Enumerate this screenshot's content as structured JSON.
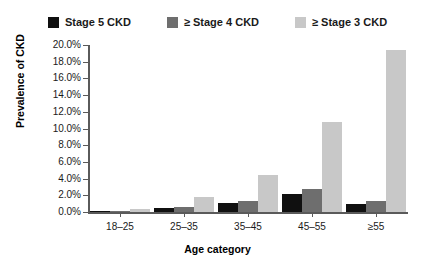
{
  "chart_data": {
    "type": "bar",
    "title": "",
    "xlabel": "Age category",
    "ylabel": "Prevalence of CKD",
    "categories": [
      "18–25",
      "25–35",
      "35–45",
      "45–55",
      "≥55"
    ],
    "ylim": [
      0,
      20
    ],
    "ytick_step": 2,
    "ytick_labels": [
      "0.0%",
      "2.0%",
      "4.0%",
      "6.0%",
      "8.0%",
      "10.0%",
      "12.0%",
      "14.0%",
      "16.0%",
      "18.0%",
      "20.0%"
    ],
    "ytick_values": [
      0,
      2,
      4,
      6,
      8,
      10,
      12,
      14,
      16,
      18,
      20
    ],
    "grid": false,
    "legend_position": "top-center",
    "series": [
      {
        "name": "Stage 5 CKD",
        "color": "#101010",
        "values": [
          0.1,
          0.5,
          1.1,
          2.2,
          1.0
        ]
      },
      {
        "name": "≥ Stage 4 CKD",
        "color": "#6e6e6e",
        "values": [
          0.15,
          0.6,
          1.3,
          2.8,
          1.3
        ]
      },
      {
        "name": "≥ Stage 3 CKD",
        "color": "#c8c8c8",
        "values": [
          0.4,
          1.8,
          4.4,
          10.8,
          19.4
        ]
      }
    ]
  }
}
